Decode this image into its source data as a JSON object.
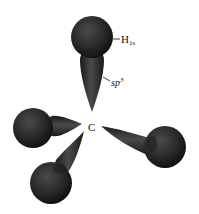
{
  "diagram": {
    "labels": {
      "carbon": "C",
      "hydrogen_orbital_main": "H",
      "hydrogen_orbital_sub": "1s",
      "hybrid_main": "sp",
      "hybrid_sup": "3"
    },
    "colors": {
      "sphere": "#2a2a2a",
      "lobe": "#2e2e2e",
      "highlight": "#555555",
      "background": "#ffffff"
    },
    "bonds": [
      {
        "name": "top",
        "direction": "up"
      },
      {
        "name": "left",
        "direction": "left"
      },
      {
        "name": "lower-left",
        "direction": "down-left"
      },
      {
        "name": "right",
        "direction": "right-down"
      }
    ]
  }
}
